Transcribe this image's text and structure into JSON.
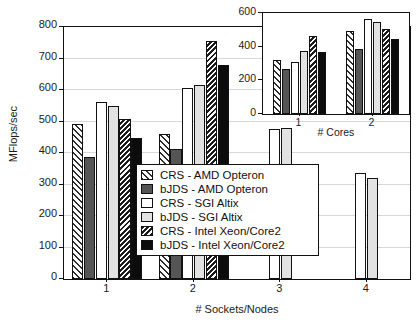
{
  "chart_data": {
    "type": "bar",
    "title": "",
    "xlabel": "# Sockets/Nodes",
    "ylabel": "MFlops/sec",
    "categories": [
      "1",
      "2",
      "3",
      "4"
    ],
    "ylim": [
      0,
      800
    ],
    "yticks": [
      0,
      100,
      200,
      300,
      400,
      500,
      600,
      700,
      800
    ],
    "ytick_labels": [
      "0",
      "100",
      "200",
      "300",
      "400",
      "500",
      "600",
      "700",
      "800"
    ],
    "grid": true,
    "legend_position": "center",
    "series": [
      {
        "name": "CRS - AMD Opteron",
        "pattern": "forward-diagonal-hatch",
        "values": [
          493,
          460,
          null,
          null
        ]
      },
      {
        "name": "bJDS - AMD Opteron",
        "pattern": "dark-gray-solid",
        "values": [
          388,
          412,
          null,
          null
        ]
      },
      {
        "name": "CRS - SGI Altix",
        "pattern": "white-solid",
        "values": [
          563,
          605,
          477,
          338
        ]
      },
      {
        "name": "bJDS - SGI Altix",
        "pattern": "light-gray-solid",
        "values": [
          548,
          615,
          480,
          320
        ]
      },
      {
        "name": "CRS - Intel Xeon/Core2",
        "pattern": "back-diagonal-hatch",
        "values": [
          508,
          757,
          null,
          null
        ]
      },
      {
        "name": "bJDS - Intel Xeon/Core2",
        "pattern": "black-solid",
        "values": [
          448,
          679,
          null,
          null
        ]
      }
    ],
    "inset": {
      "type": "bar",
      "xlabel": "# Cores",
      "ylabel": "",
      "categories": [
        "1",
        "2"
      ],
      "ylim": [
        0,
        600
      ],
      "yticks": [
        0,
        200,
        400,
        600
      ],
      "ytick_labels": [
        "0",
        "200",
        "400",
        "600"
      ],
      "grid": false,
      "series": [
        {
          "name": "CRS - AMD Opteron",
          "pattern": "forward-diagonal-hatch",
          "values": [
            320,
            493
          ]
        },
        {
          "name": "bJDS - AMD Opteron",
          "pattern": "dark-gray-solid",
          "values": [
            268,
            388
          ]
        },
        {
          "name": "CRS - SGI Altix",
          "pattern": "white-solid",
          "values": [
            308,
            563
          ]
        },
        {
          "name": "bJDS - SGI Altix",
          "pattern": "light-gray-solid",
          "values": [
            372,
            548
          ]
        },
        {
          "name": "CRS - Intel Xeon/Core2",
          "pattern": "back-diagonal-hatch",
          "values": [
            462,
            508
          ]
        },
        {
          "name": "bJDS - Intel Xeon/Core2",
          "pattern": "black-solid",
          "values": [
            366,
            448
          ]
        }
      ]
    }
  },
  "legend": {
    "items": [
      {
        "label": "CRS - AMD Opteron",
        "swatch": "forward-diagonal-hatch"
      },
      {
        "label": "bJDS - AMD Opteron",
        "swatch": "dark-gray-solid"
      },
      {
        "label": "CRS - SGI Altix",
        "swatch": "white-solid"
      },
      {
        "label": "bJDS - SGI Altix",
        "swatch": "light-gray-solid"
      },
      {
        "label": "CRS - Intel Xeon/Core2",
        "swatch": "back-diagonal-hatch"
      },
      {
        "label": "bJDS - Intel Xeon/Core2",
        "swatch": "black-solid"
      }
    ]
  },
  "colors": {
    "axis": "#111111",
    "grid": "#d8d8d8",
    "dark_gray": "#555555",
    "light_gray": "#e2e2e2",
    "black": "#0c0c0c",
    "white": "#ffffff"
  }
}
